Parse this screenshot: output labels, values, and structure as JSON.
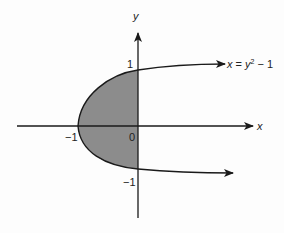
{
  "figure": {
    "type": "parabola-region",
    "equation_label": {
      "lhs": "x",
      "eq": " = ",
      "base": "y",
      "exp": "2",
      "rest": " − 1"
    },
    "axes": {
      "x_label": "x",
      "y_label": "y",
      "origin_label": "0"
    },
    "ticks": {
      "x_neg1": "−1",
      "y_pos1": "1",
      "y_neg1": "−1"
    },
    "colors": {
      "shade": "#8c8c8c",
      "stroke": "#1a1a1a",
      "background": "#fdfdfd"
    },
    "shaded_region": "area between x = y^2 − 1 and the y-axis for −1 ≤ y ≤ 1"
  }
}
